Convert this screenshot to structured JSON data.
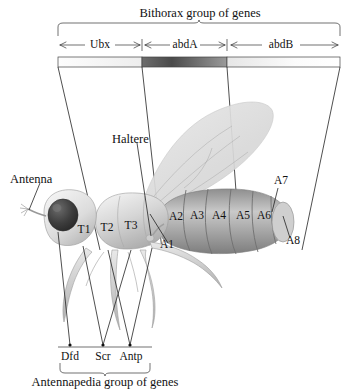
{
  "figure": {
    "title_top": "Bithorax group of genes",
    "title_bottom": "Antennapedia group of genes",
    "gene_axis": {
      "segments": [
        {
          "label": "Ubx",
          "x_start": 58,
          "x_end": 142
        },
        {
          "label": "abdA",
          "x_start": 142,
          "x_end": 227
        },
        {
          "label": "abdB",
          "x_start": 227,
          "x_end": 340
        }
      ],
      "bar_y": 58,
      "bar_height": 9,
      "shaded_segment": "abdA"
    },
    "antennapedia_genes": [
      {
        "label": "Dfd",
        "x": 70
      },
      {
        "label": "Scr",
        "x": 103
      },
      {
        "label": "Antp",
        "x": 130
      }
    ],
    "fly_labels": {
      "antenna": "Antenna",
      "haltere": "Haltere",
      "thoracic": [
        {
          "label": "T1",
          "x": 84,
          "y": 232
        },
        {
          "label": "T2",
          "x": 107,
          "y": 230
        },
        {
          "label": "T3",
          "x": 130,
          "y": 228
        }
      ],
      "abdominal": [
        {
          "label": "A1",
          "x": 167,
          "y": 247
        },
        {
          "label": "A2",
          "x": 176,
          "y": 219
        },
        {
          "label": "A3",
          "x": 196,
          "y": 218
        },
        {
          "label": "A4",
          "x": 218,
          "y": 218
        },
        {
          "label": "A5",
          "x": 243,
          "y": 218
        },
        {
          "label": "A6",
          "x": 263,
          "y": 218
        },
        {
          "label": "A7",
          "x": 281,
          "y": 183
        },
        {
          "label": "A8",
          "x": 292,
          "y": 243
        }
      ]
    },
    "colors": {
      "ink": "#111111",
      "bar_shade_dark": "#555555",
      "bar_shade_light": "#f2f2f2",
      "body_gray": "#b9b9b9",
      "wing_gray": "#d8d8d8",
      "eye_dark": "#3a3a3a"
    }
  }
}
